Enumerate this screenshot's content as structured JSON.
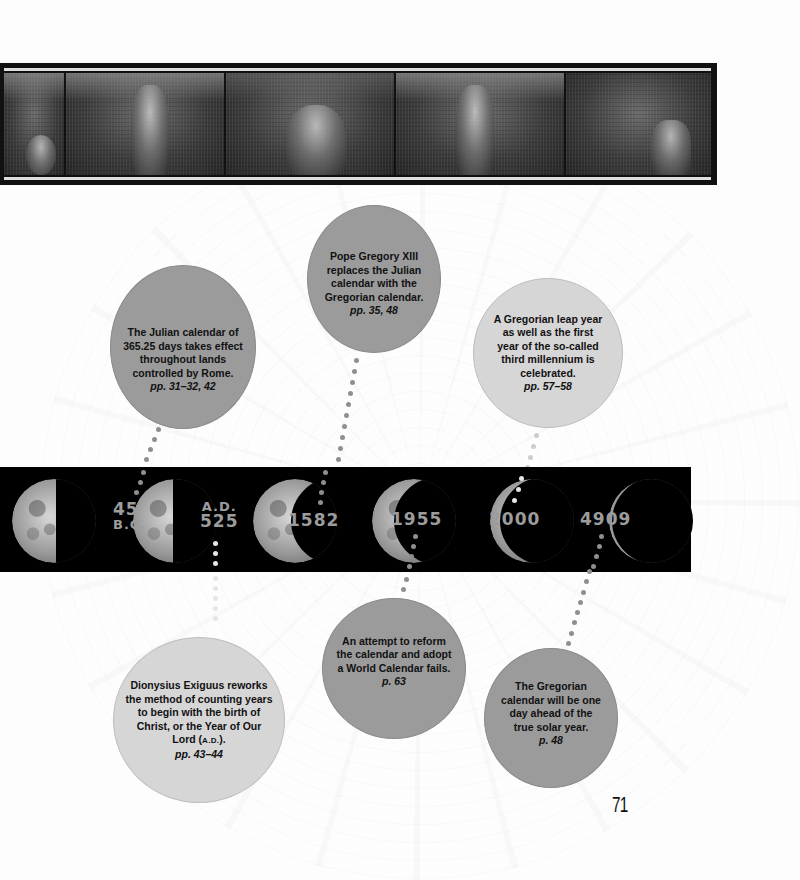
{
  "page": {
    "page_number": "71",
    "background_color": "#fdfdfd"
  },
  "banner": {
    "description": "Engraved illustration strip of medieval seasonal labors",
    "panels": [
      "panel-1",
      "panel-2",
      "panel-3",
      "panel-4",
      "panel-5"
    ]
  },
  "timeline": {
    "band_color": "#000000",
    "year_color": "#9c9c9c",
    "markers": [
      {
        "id": "45bc",
        "year": "45",
        "era": "B.C."
      },
      {
        "id": "525",
        "era_prefix": "A.D.",
        "year": "525"
      },
      {
        "id": "1582",
        "year": "1582"
      },
      {
        "id": "1955",
        "year": "1955"
      },
      {
        "id": "2000",
        "year": "2000"
      },
      {
        "id": "4909",
        "year": "4909"
      }
    ]
  },
  "events": {
    "julian": {
      "text": "The Julian calendar of 365.25 days takes effect throughout lands controlled by Rome.",
      "ref": "pp. 31–32, 42",
      "shade": "dark"
    },
    "gregory": {
      "text": "Pope Gregory XIII replaces the Julian calendar with the Gregorian calendar.",
      "ref": "pp. 35, 48",
      "shade": "dark"
    },
    "leap2000": {
      "text": "A Gregorian leap year as well as the first year of the so-called third millennium is celebrated.",
      "ref": "pp. 57–58",
      "shade": "light"
    },
    "dionysius": {
      "text_before": "Dionysius Exiguus reworks the method of counting years to begin with the birth of Christ, or the Year of Our Lord (",
      "abbr": "A.D.",
      "text_after": ").",
      "ref": "pp. 43–44",
      "shade": "light"
    },
    "world_calendar": {
      "text": "An attempt to reform the calendar and adopt a World Calendar fails.",
      "ref": "p. 63",
      "shade": "dark"
    },
    "drift4909": {
      "text": "The Gregorian calendar will be one day ahead of the true solar year.",
      "ref": "p. 48",
      "shade": "dark"
    }
  },
  "colors": {
    "dark_circle": "#9b9b9b",
    "light_circle": "#d6d6d6",
    "text": "#111111"
  }
}
